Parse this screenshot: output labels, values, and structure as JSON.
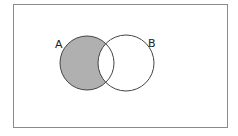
{
  "diagram": {
    "type": "venn",
    "sets": [
      {
        "label": "A",
        "cx": 87,
        "cy": 63,
        "r": 27,
        "label_x": 55,
        "label_y": 48
      },
      {
        "label": "B",
        "cx": 126,
        "cy": 63,
        "r": 28,
        "label_x": 148,
        "label_y": 47
      }
    ],
    "shaded_region": "A minus B",
    "colors": {
      "fill": "#b0b0b0",
      "stroke": "#444444",
      "border": "#8a8a8a",
      "background": "#ffffff"
    }
  }
}
